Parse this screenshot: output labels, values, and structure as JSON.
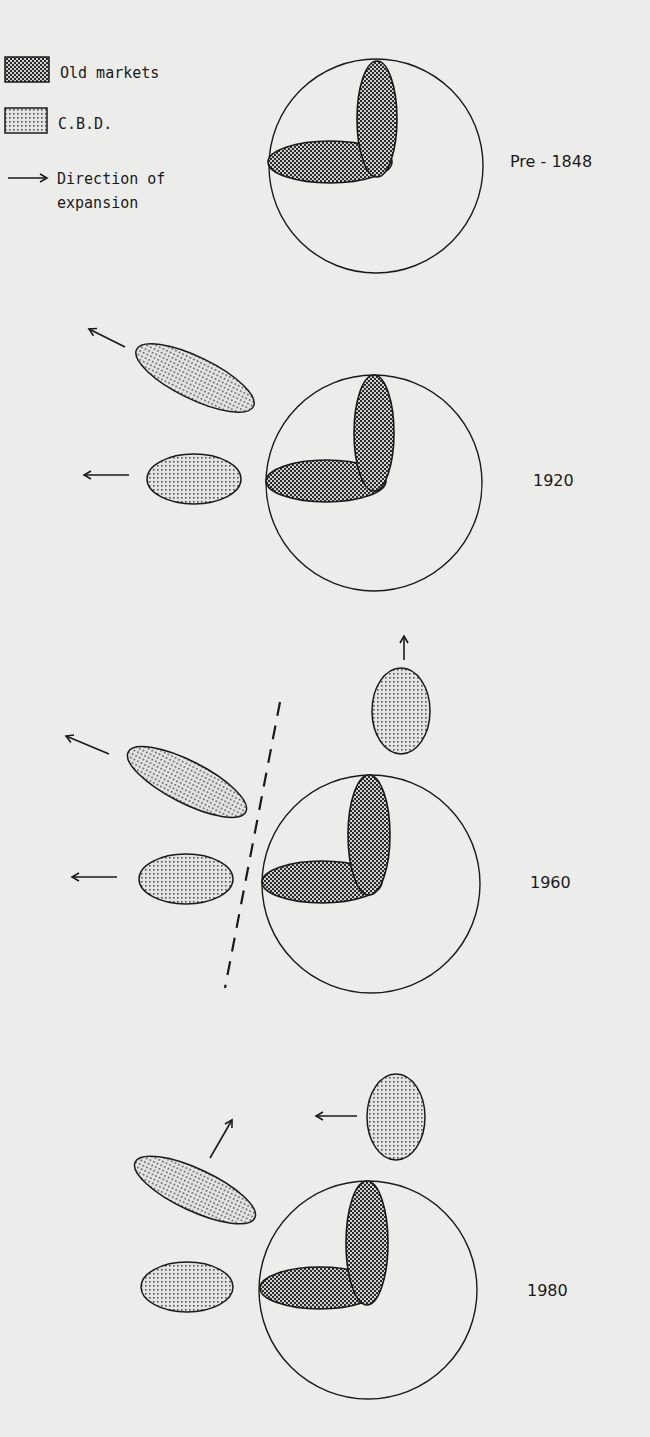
{
  "legend": {
    "old_markets": "Old markets",
    "cbd": "C.B.D.",
    "direction_line1": "Direction of",
    "direction_line2": "expansion"
  },
  "colors": {
    "background": "#ececea",
    "ink": "#1a1a1a",
    "old_markets_fill": "#7a7a7a",
    "cbd_fill": "#b8b8b8"
  },
  "panels": [
    {
      "label": "Pre - 1848"
    },
    {
      "label": "1920"
    },
    {
      "label": "1960"
    },
    {
      "label": "1980"
    }
  ]
}
